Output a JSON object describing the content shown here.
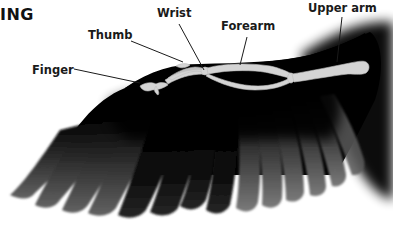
{
  "diagram": {
    "title": "ING",
    "labels": [
      {
        "id": "wrist",
        "text": "Wrist"
      },
      {
        "id": "thumb",
        "text": "Thumb"
      },
      {
        "id": "forearm",
        "text": "Forearm"
      },
      {
        "id": "upper_arm",
        "text": "Upper arm"
      },
      {
        "id": "finger",
        "text": "Finger"
      }
    ],
    "colors": {
      "background": "#ffffff",
      "wing": "#000000",
      "feather_light": "#6a6a6a",
      "bone": "#d6d6d6",
      "label_text": "#1a1a1a",
      "leader_line": "#1a1a1a"
    }
  }
}
